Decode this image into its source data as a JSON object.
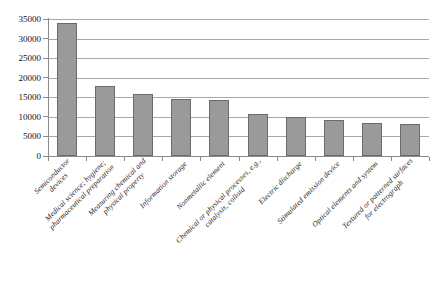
{
  "chart_data": {
    "type": "bar",
    "title": "",
    "xlabel": "",
    "ylabel": "",
    "ylim": [
      0,
      35000
    ],
    "ytick_step": 5000,
    "yticks": [
      35000,
      30000,
      25000,
      20000,
      15000,
      10000,
      5000,
      0
    ],
    "ytick_labels": [
      "35000",
      "30000",
      "25000",
      "20000",
      "15000",
      "10000",
      "5000",
      "0"
    ],
    "grid": true,
    "legend": "none",
    "bar_color": "#9a9a9a",
    "bar_edge_color": "#6b6b6b",
    "gridline_color": "#a8a8a8",
    "axis_color": "#8a8a8a",
    "background_color": "#ffffff",
    "categories": [
      "Semiconductor devices",
      "Medical science; hygiene; pharmaceutical preparation",
      "Measuring chemical and physical property",
      "Information storage",
      "Nonmetallic element",
      "Chemical or physical processes, e.g., catalysis, colloid",
      "Electric discharge",
      "Stimulated emission device",
      "Optical elements and system",
      "Textured or patterned surfaces for electrograph"
    ],
    "category_lines": [
      [
        "Semiconductor",
        "devices"
      ],
      [
        "Medical science; hygiene;",
        "pharmaceutical preparation"
      ],
      [
        "Measuring chemical and",
        "physical property"
      ],
      [
        "Information storage",
        ""
      ],
      [
        "Nonmetallic element",
        ""
      ],
      [
        "Chemical or physical processes, e.g.,",
        "catalysis, colloid"
      ],
      [
        "Electric discharge",
        ""
      ],
      [
        "Stimulated emission device",
        ""
      ],
      [
        "Optical elements and system",
        ""
      ],
      [
        "Textured or patterned surfaces",
        "for electrograph"
      ]
    ],
    "values": [
      34000,
      18000,
      15800,
      14500,
      14400,
      10800,
      9900,
      9100,
      8500,
      8200
    ],
    "series": [
      {
        "name": "Patent count",
        "values": [
          34000,
          18000,
          15800,
          14500,
          14400,
          10800,
          9900,
          9100,
          8500,
          8200
        ]
      }
    ]
  }
}
